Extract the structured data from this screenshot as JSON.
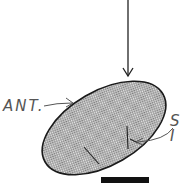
{
  "figure": {
    "type": "specimen-illustration",
    "labels": {
      "anterior": "ANT.",
      "structure": "S I"
    },
    "colors": {
      "outline": "#222222",
      "fill_pattern": "#9a9a9a",
      "scale_bar": "#111111",
      "label_text": "#555555"
    }
  }
}
